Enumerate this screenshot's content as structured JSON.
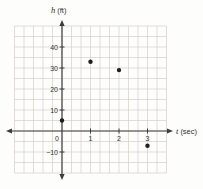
{
  "figure": {
    "background": "#fdfdfc",
    "description_visible_text": [
      "h (ft)",
      "t (sec)",
      "40",
      "30",
      "20",
      "10",
      "0",
      "-10",
      "1",
      "2",
      "3"
    ]
  },
  "chart_data": {
    "type": "scatter",
    "title": "",
    "xlabel": "t (sec)",
    "ylabel": "h (ft)",
    "xlabel_var": "t",
    "xlabel_unit": "(sec)",
    "ylabel_var": "h",
    "ylabel_unit": "(ft)",
    "points": [
      {
        "t": 0,
        "h": 5
      },
      {
        "t": 1,
        "h": 33
      },
      {
        "t": 2,
        "h": 29
      },
      {
        "t": 3,
        "h": -7
      }
    ],
    "x_tick_values": [
      1,
      2,
      3
    ],
    "x_tick_labels": [
      "1",
      "2",
      "3"
    ],
    "y_tick_values": [
      40,
      30,
      20,
      10,
      -10
    ],
    "y_tick_labels": [
      "40",
      "30",
      "20",
      "10",
      "−10"
    ],
    "origin_label": "0",
    "xlim": [
      -1.7,
      3.5
    ],
    "ylim": [
      -21,
      52
    ],
    "grid": true,
    "x_grid_step_sec": 0.333,
    "y_grid_step_ft": 5,
    "legend": "none",
    "colors": {
      "point": "#1f1f1f",
      "axis": "#3c3c3c",
      "grid": "#d4cec5",
      "label": "#333333"
    }
  }
}
